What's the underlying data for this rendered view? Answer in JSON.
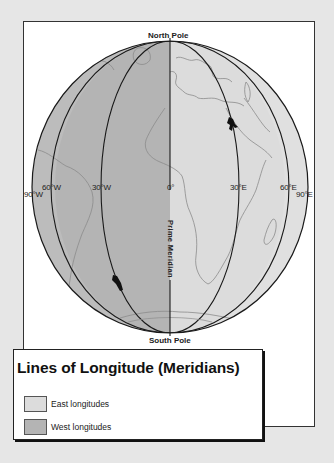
{
  "diagram": {
    "title": "Lines of Longitude (Meridians)",
    "north_pole_label": "North Pole",
    "south_pole_label": "South Pole",
    "prime_meridian_label": "Prime Meridian",
    "meridian_labels": {
      "w90": "90°W",
      "w60": "60°W",
      "w30": "30°W",
      "zero": "0°",
      "e30": "30°E",
      "e60": "60°E",
      "e90": "90°E"
    },
    "colors": {
      "east_fill": "#dcdcdc",
      "west_fill": "#b4b4b4",
      "background": "#e6e6e6",
      "line": "#1a1a1a",
      "coastline": "#8c8c8c"
    }
  },
  "legend": {
    "items": [
      {
        "label": "East longitudes",
        "color": "#dcdcdc"
      },
      {
        "label": "West longitudes",
        "color": "#b4b4b4"
      }
    ]
  }
}
